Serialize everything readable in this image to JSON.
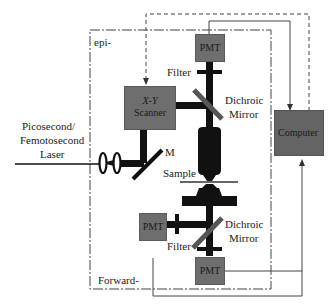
{
  "diagram": {
    "labels": {
      "epi": "epi-",
      "forward": "Forward-",
      "laser_line1": "Picosecond/",
      "laser_line2": "Femotosecond",
      "laser_line3": "Laser",
      "scanner_line1": "X-Y",
      "scanner_line2": "Scanner",
      "mirror_m": "M",
      "sample": "Sample",
      "filter_top": "Filter",
      "filter_bottom": "Filter",
      "dichroic_top_line1": "Dichroic",
      "dichroic_top_line2": "Mirror",
      "dichroic_bottom_line1": "Dichroic",
      "dichroic_bottom_line2": "Mirror",
      "pmt_top": "PMT",
      "pmt_left": "PMT",
      "pmt_bottom": "PMT",
      "computer": "Computer"
    },
    "colors": {
      "box_fill": "#6e6e6e",
      "box_border": "#5a5a5a",
      "beam": "#1a1a1a",
      "line": "#333333"
    }
  }
}
